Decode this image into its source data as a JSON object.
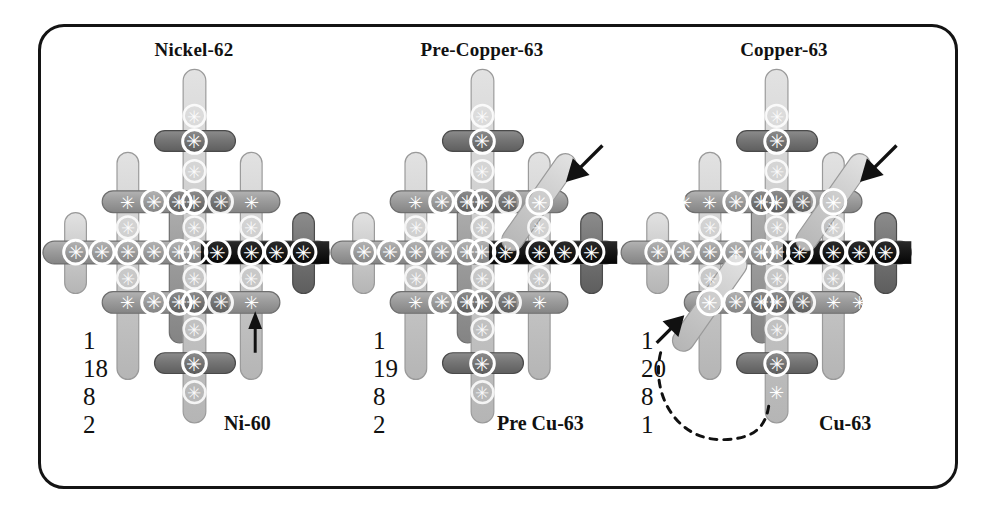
{
  "figure": {
    "background": "#ffffff",
    "border_color": "#141414",
    "palette": {
      "bar_light": "#cfcfcf",
      "bar_light_edge": "#9a9a9a",
      "bar_mid": "#9e9e9e",
      "bar_mid_edge": "#6f6f6f",
      "bar_dark": "#777777",
      "bar_dark_edge": "#4a4a4a",
      "bar_black": "#1a1a1a",
      "bar_black_edge": "#000000",
      "node_ring": "#ffffff",
      "arrow": "#111111",
      "text": "#111111"
    }
  },
  "panels": [
    {
      "id": "nickel62",
      "title": "Nickel-62",
      "isotope_label": "Ni-60",
      "shell_numbers": [
        "1",
        "18",
        "8",
        "2"
      ],
      "arrow": {
        "type": "straight-up",
        "label": "up-arrow"
      },
      "diagonal_bars": 0,
      "dashed_curve": false
    },
    {
      "id": "precopper63",
      "title": "Pre-Copper-63",
      "isotope_label": "Pre Cu-63",
      "shell_numbers": [
        "1",
        "19",
        "8",
        "2"
      ],
      "arrow": {
        "type": "diagonal-down-left",
        "label": "diagonal-arrow"
      },
      "diagonal_bars": 1,
      "dashed_curve": false
    },
    {
      "id": "copper63",
      "title": "Copper-63",
      "isotope_label": "Cu-63",
      "shell_numbers": [
        "1",
        "20",
        "8",
        "1"
      ],
      "arrow": {
        "type": "diagonal-down-left",
        "label": "diagonal-arrow"
      },
      "diagonal_bars": 2,
      "dashed_curve": true
    }
  ],
  "legend_note": {
    "nodes_glyph": "asterisk-in-circle",
    "bar_shape": "rounded-capsule"
  }
}
